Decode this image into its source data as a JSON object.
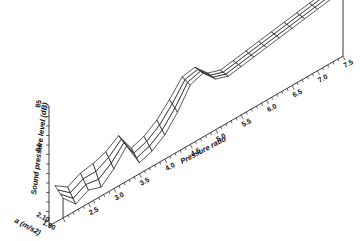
{
  "chart_data": {
    "type": "surface3d",
    "title": "",
    "xlabel": "Pressure ratio",
    "ylabel": "a (m/s2)",
    "zlabel": "Sound pressure level (dB)",
    "x_ticks": [
      "2.5",
      "3.0",
      "3.5",
      "4.0",
      "4.5",
      "5.0",
      "5.5",
      "6.0",
      "6.5",
      "7.0",
      "7.5"
    ],
    "y_ticks": [
      "1.90",
      "2.10"
    ],
    "z_ticks": [
      "84",
      "85"
    ],
    "xlim": [
      2.0,
      7.5
    ],
    "ylim": [
      1.9,
      2.1
    ],
    "zlim": [
      83.4,
      85.0
    ],
    "grid": false,
    "x": [
      2.0,
      2.25,
      2.5,
      2.75,
      3.0,
      3.25,
      3.5,
      3.75,
      4.0,
      4.25,
      4.5,
      4.75,
      5.0,
      5.25,
      5.5,
      5.75,
      6.0,
      6.25,
      6.5,
      6.75,
      7.0,
      7.25,
      7.5
    ],
    "series": [
      {
        "name": "a=1.90",
        "values": [
          83.85,
          83.55,
          83.7,
          83.6,
          83.85,
          84.2,
          83.65,
          83.75,
          83.95,
          84.3,
          84.75,
          84.85,
          84.55,
          84.45,
          84.5,
          84.55,
          84.6,
          84.65,
          84.7,
          84.75,
          84.8,
          84.85,
          84.9
        ]
      },
      {
        "name": "a=2.10",
        "values": [
          84.0,
          83.8,
          83.95,
          84.0,
          84.1,
          84.3,
          83.85,
          83.95,
          84.15,
          84.45,
          84.8,
          84.85,
          84.55,
          84.45,
          84.5,
          84.55,
          84.6,
          84.65,
          84.7,
          84.75,
          84.8,
          84.85,
          84.9
        ]
      }
    ],
    "annotations": [
      "Peak near pressure ratio 3.2",
      "Main peak near pressure ratio 4.6"
    ]
  },
  "labels": {
    "x_axis_title": "Pressure ratio",
    "y_axis_title": "a (m/s2)",
    "z_axis_title": "Sound pressure level (dB)",
    "x_ticks": [
      "2.5",
      "3.0",
      "3.5",
      "4.0",
      "4.5",
      "5.0",
      "5.5",
      "6.0",
      "6.5",
      "7.0",
      "7.5"
    ],
    "y_tick_low": "1.90",
    "y_tick_high": "2.10",
    "z_tick_84": "84",
    "z_tick_85": "85"
  }
}
